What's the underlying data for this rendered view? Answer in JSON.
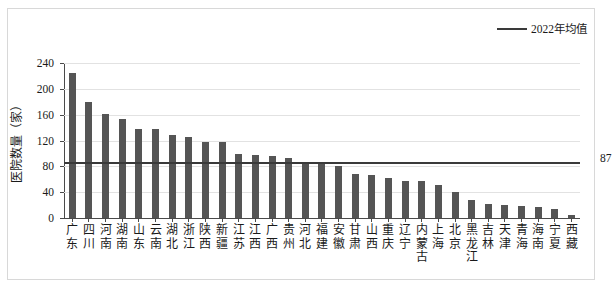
{
  "chart_data": {
    "type": "bar",
    "title": "",
    "xlabel": "",
    "ylabel": "医院数量（家）",
    "ylim": [
      0,
      240
    ],
    "yticks": [
      0,
      40,
      80,
      120,
      160,
      200,
      240
    ],
    "grid": true,
    "categories": [
      "广东",
      "四川",
      "河南",
      "湖南",
      "山东",
      "云南",
      "湖北",
      "浙江",
      "陕西",
      "新疆",
      "江苏",
      "江西",
      "广西",
      "贵州",
      "河北",
      "福建",
      "安徽",
      "甘肃",
      "山西",
      "重庆",
      "辽宁",
      "内蒙古",
      "上海",
      "北京",
      "黑龙江",
      "吉林",
      "天津",
      "青海",
      "海南",
      "宁夏",
      "西藏"
    ],
    "values": [
      225,
      179,
      161,
      153,
      138,
      138,
      129,
      126,
      117,
      117,
      99,
      97,
      96,
      93,
      87,
      83,
      81,
      68,
      66,
      62,
      58,
      57,
      51,
      41,
      28,
      21,
      20,
      19,
      17,
      14,
      5
    ],
    "series": [
      {
        "name": "医院数量（家）",
        "values": [
          225,
          179,
          161,
          153,
          138,
          138,
          129,
          126,
          117,
          117,
          99,
          97,
          96,
          93,
          87,
          83,
          81,
          68,
          66,
          62,
          58,
          57,
          51,
          41,
          28,
          21,
          20,
          19,
          17,
          14,
          5
        ]
      }
    ],
    "reference_line": {
      "label": "2022年均值",
      "value": 87,
      "value_text": "87",
      "color": "#3a3a3a"
    },
    "legend": {
      "position": "top-right",
      "entries": [
        {
          "label": "2022年均值",
          "marker": "line",
          "color": "#3a3a3a"
        }
      ]
    },
    "colors": {
      "bar": "#555555",
      "reference_line": "#3a3a3a",
      "grid": "#e2e2e2",
      "axis": "#4a4a4a",
      "background": "#ffffff"
    }
  }
}
